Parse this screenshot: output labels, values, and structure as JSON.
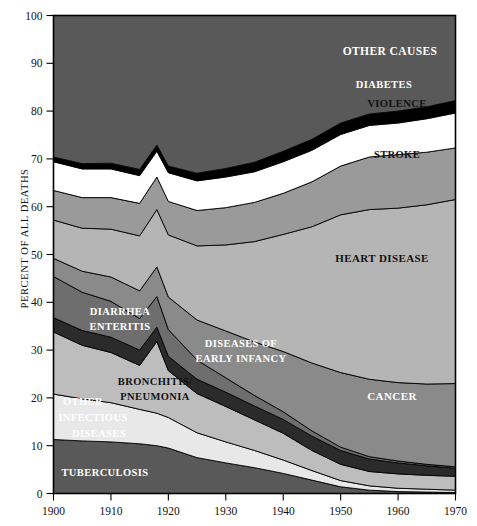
{
  "axes": {
    "y_title": "PERCENT OF ALL DEATHS",
    "y_ticks": [
      "0",
      "10",
      "20",
      "30",
      "40",
      "50",
      "60",
      "70",
      "80",
      "90",
      "100"
    ],
    "x_ticks": [
      "1900",
      "1910",
      "1920",
      "1930",
      "1940",
      "1950",
      "1960",
      "1970"
    ]
  },
  "labels": {
    "other_causes": "OTHER CAUSES",
    "diabetes": "DIABETES",
    "violence": "VIOLENCE",
    "stroke": "STROKE",
    "heart_disease": "HEART  DISEASE",
    "cancer": "CANCER",
    "diarrhea_1": "DIARRHEA",
    "diarrhea_2": "ENTERITIS",
    "infancy_1": "DISEASES OF",
    "infancy_2": "EARLY INFANCY",
    "bronchitis_1": "BRONCHITIS/",
    "bronchitis_2": "PNEUMONIA",
    "otherinf_1": "OTHER",
    "otherinf_2": "INFECTIOUS",
    "otherinf_3": "DISEASES",
    "tuberculosis": "TUBERCULOSIS"
  },
  "colors": {
    "tuberculosis": "#595959",
    "other_infectious": "#e8e8e8",
    "bronchitis_pneumonia": "#bdbdbd",
    "early_infancy": "#2b2b2b",
    "diarrhea_enteritis": "#6e6e6e",
    "cancer": "#8a8a8a",
    "heart_disease": "#b5b5b5",
    "stroke": "#9a9a9a",
    "violence": "#ffffff",
    "diabetes": "#000000",
    "other_causes": "#595959",
    "axis": "#000000",
    "background": "#ffffff"
  },
  "chart_data": {
    "type": "area",
    "title": "",
    "xlabel": "",
    "ylabel": "PERCENT OF ALL DEATHS",
    "xlim": [
      1900,
      1970
    ],
    "ylim": [
      0,
      100
    ],
    "grid": false,
    "legend": "inline-band-labels",
    "stacked": true,
    "x": [
      1900,
      1905,
      1910,
      1915,
      1918,
      1920,
      1925,
      1930,
      1935,
      1940,
      1945,
      1950,
      1955,
      1960,
      1965,
      1970
    ],
    "series": [
      {
        "name": "TUBERCULOSIS",
        "values": [
          11.3,
          11.0,
          10.8,
          10.4,
          10.0,
          9.5,
          7.5,
          6.4,
          5.4,
          4.2,
          2.8,
          1.4,
          0.7,
          0.4,
          0.3,
          0.2
        ]
      },
      {
        "name": "OTHER INFECTIOUS DISEASES",
        "values": [
          9.5,
          8.8,
          8.2,
          7.2,
          6.8,
          6.4,
          5.2,
          4.4,
          3.6,
          2.8,
          2.0,
          1.3,
          0.9,
          0.7,
          0.6,
          0.5
        ]
      },
      {
        "name": "BRONCHITIS/PNEUMONIA",
        "values": [
          13.0,
          11.2,
          10.5,
          9.2,
          15.0,
          9.8,
          8.2,
          7.4,
          6.4,
          5.6,
          4.2,
          3.4,
          3.0,
          3.0,
          2.9,
          2.9
        ]
      },
      {
        "name": "DISEASES OF EARLY INFANCY",
        "values": [
          3.0,
          3.1,
          3.2,
          3.2,
          3.0,
          3.0,
          3.0,
          3.0,
          2.9,
          2.9,
          3.0,
          2.9,
          2.6,
          2.3,
          2.0,
          1.7
        ]
      },
      {
        "name": "DIARRHEA ENTERITIS",
        "values": [
          8.6,
          8.0,
          7.5,
          6.6,
          6.4,
          5.6,
          4.0,
          3.0,
          2.2,
          1.6,
          1.1,
          0.7,
          0.5,
          0.4,
          0.3,
          0.3
        ]
      },
      {
        "name": "CANCER",
        "values": [
          3.8,
          4.4,
          5.1,
          5.8,
          6.2,
          6.8,
          8.4,
          9.8,
          11.2,
          12.6,
          14.2,
          15.6,
          16.2,
          16.4,
          16.8,
          17.4
        ]
      },
      {
        "name": "HEART DISEASE",
        "values": [
          8.0,
          9.0,
          10.0,
          11.5,
          12.0,
          13.0,
          15.5,
          18.0,
          21.0,
          24.5,
          28.5,
          33.0,
          35.5,
          36.5,
          37.5,
          38.5
        ]
      },
      {
        "name": "STROKE",
        "values": [
          6.2,
          6.4,
          6.6,
          6.8,
          6.8,
          7.0,
          7.4,
          7.8,
          8.2,
          8.6,
          9.4,
          10.2,
          11.0,
          11.2,
          11.0,
          10.8
        ]
      },
      {
        "name": "VIOLENCE",
        "values": [
          6.0,
          6.0,
          6.0,
          5.8,
          5.4,
          6.0,
          6.2,
          6.4,
          6.4,
          6.6,
          6.6,
          6.6,
          6.6,
          6.6,
          7.0,
          7.3
        ]
      },
      {
        "name": "DIABETES",
        "values": [
          1.0,
          1.1,
          1.2,
          1.3,
          1.3,
          1.4,
          1.6,
          1.8,
          2.0,
          2.2,
          2.3,
          2.4,
          2.4,
          2.5,
          2.5,
          2.6
        ]
      },
      {
        "name": "OTHER CAUSES",
        "values": [
          29.6,
          31.0,
          30.9,
          32.2,
          27.1,
          31.5,
          33.0,
          32.0,
          30.7,
          28.4,
          25.9,
          22.5,
          20.6,
          20.0,
          19.1,
          17.8
        ]
      }
    ]
  }
}
